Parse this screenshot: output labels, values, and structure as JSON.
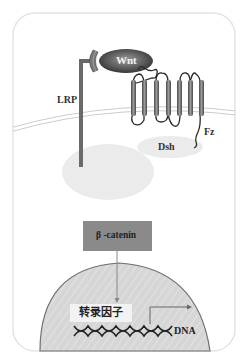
{
  "diagram": {
    "labels": {
      "wnt": "Wnt",
      "lrp": "LRP",
      "fz": "Fz",
      "dsh": "Dsh",
      "beta_catenin": "β -catenin",
      "transcription_factor": "转录因子",
      "dna": "DNA"
    },
    "colors": {
      "cell_border": "#e6e6e6",
      "membrane": "#cfcfcf",
      "receptor": "#6f6f6f",
      "wnt_fill": "#555555",
      "dsh_fill": "#ececec",
      "complex_fill": "#eeeeee",
      "catenin_box": "#8a8a8a",
      "nucleus_fill": "#d9d9d9",
      "nucleus_border": "#777777",
      "tf_box": "#f4f4f4"
    }
  }
}
